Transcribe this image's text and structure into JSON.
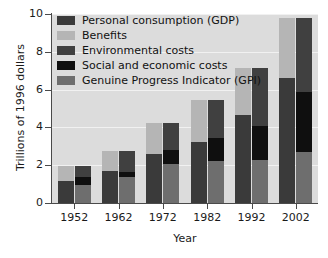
{
  "chart_data": {
    "type": "bar",
    "title": "",
    "subtitle": "",
    "xlabel": "Year",
    "ylabel": "Trillions of 1996 dollars",
    "categories": [
      "1952",
      "1962",
      "1972",
      "1982",
      "1992",
      "2002"
    ],
    "ylim": [
      0,
      10
    ],
    "yticks": [
      0,
      2,
      4,
      6,
      8,
      10
    ],
    "ytick_labels": [
      "0",
      "2",
      "4",
      "6",
      "8",
      "10"
    ],
    "grid": true,
    "grid_axis": "y",
    "legend_position": "top-left",
    "stacked": true,
    "bar_groups": [
      {
        "name": "GDP bar",
        "description": "left bar of each pair",
        "series": [
          {
            "name": "Personal consumption (GDP)",
            "color": "#3a3a3a",
            "values": [
              1.15,
              1.68,
              2.58,
              3.22,
              4.65,
              6.6
            ]
          },
          {
            "name": "Benefits",
            "color": "#b5b5b5",
            "values": [
              0.8,
              1.08,
              1.67,
              2.23,
              2.5,
              3.2
            ]
          }
        ],
        "totals": [
          1.95,
          2.76,
          4.25,
          5.45,
          7.15,
          9.8
        ]
      },
      {
        "name": "GPI bar",
        "description": "right bar of each pair",
        "series": [
          {
            "name": "Genuine Progress Indicator (GPI)",
            "color": "#6e6e6e",
            "values": [
              0.93,
              1.36,
              2.08,
              2.22,
              2.26,
              2.7
            ]
          },
          {
            "name": "Social and economic costs",
            "color": "#0f0f0f",
            "values": [
              0.45,
              0.3,
              0.7,
              1.21,
              1.8,
              3.2
            ]
          },
          {
            "name": "Environmental costs",
            "color": "#404040",
            "values": [
              0.57,
              1.1,
              1.47,
              2.02,
              3.09,
              3.9
            ]
          }
        ],
        "totals": [
          1.95,
          2.76,
          4.25,
          5.45,
          7.15,
          9.8
        ]
      }
    ],
    "legend": [
      {
        "label": "Personal consumption (GDP)",
        "color": "#3a3a3a"
      },
      {
        "label": "Benefits",
        "color": "#b5b5b5"
      },
      {
        "label": "Environmental costs",
        "color": "#404040"
      },
      {
        "label": "Social and economic costs",
        "color": "#0f0f0f"
      },
      {
        "label": "Genuine Progress Indicator (GPI)",
        "color": "#6e6e6e"
      }
    ],
    "plot_background": "#dcdcdc",
    "gridline_color": "#f1f1f1",
    "axis_color": "#4a4a4a",
    "text_color": "#1a1a1a"
  }
}
